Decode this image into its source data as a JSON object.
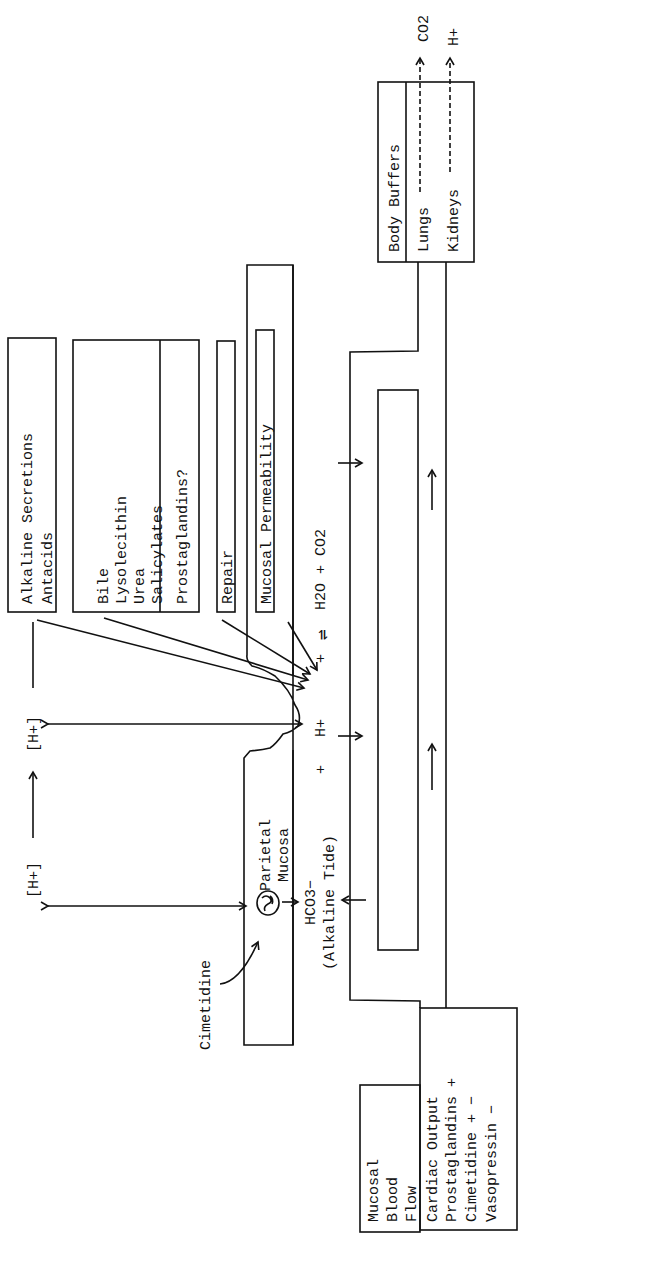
{
  "diagram": {
    "title_hint": "Gastric acid / mucosal barrier and buffering schematic (rotated)",
    "top_labels": {
      "h_lumen_left": "[H+]",
      "h_lumen_right": "[H+]"
    },
    "luminal_factors": {
      "alkaline_box": [
        "Alkaline Secretions",
        "Antacids"
      ],
      "injury_box": [
        "Bile",
        "Lysolecithin",
        "Urea",
        "Salicylates"
      ],
      "prostaglandins": "Prostaglandins?",
      "repair": "Repair",
      "mucosal_permeability": "Mucosal Permeability"
    },
    "mucosa": {
      "label_line1": "Parietal",
      "label_line2": "Mucosa",
      "drug": "Cimetidine"
    },
    "reaction": {
      "bicarbonate": "HCO3−",
      "alkaline_tide": "(Alkaline Tide)",
      "plus1": "+",
      "proton": "H+",
      "plus2": "+",
      "equilibrium": "⇌",
      "products": "H2O + CO2"
    },
    "buffers": {
      "title": "Body Buffers",
      "lungs": "Lungs",
      "lungs_output": "CO2",
      "kidneys": "Kidneys",
      "kidneys_output": "H+"
    },
    "blood_flow": {
      "title": [
        "Mucosal",
        "Blood",
        "Flow"
      ],
      "factors": [
        "Cardiac Output",
        "Prostaglandins +",
        "Cimetidine + −",
        "Vasopressin −"
      ]
    }
  }
}
